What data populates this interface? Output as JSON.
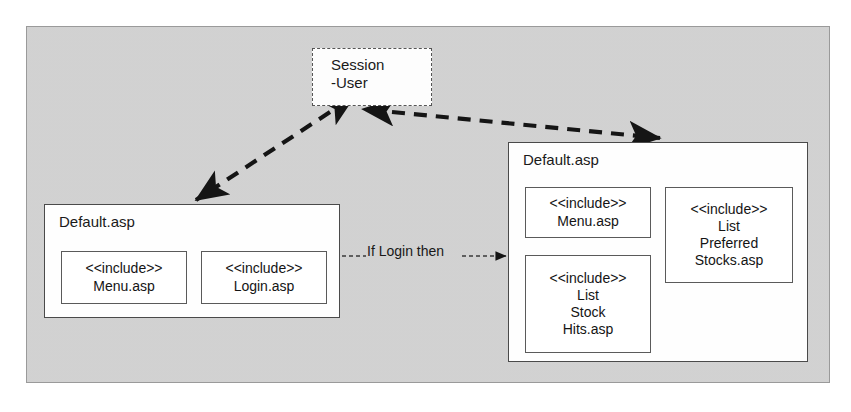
{
  "diagram": {
    "type": "component-include-diagram",
    "background_color": "#d3d3d3",
    "node_fill_color": "#ffffff",
    "line_color": "#1a1a1a"
  },
  "session": {
    "label": "Session\n-User",
    "border_style": "dashed"
  },
  "page_left": {
    "title": "Default.asp",
    "includes": [
      {
        "stereotype": "<<include>>",
        "name": "Menu.asp",
        "label": "<<include>>\nMenu.asp"
      },
      {
        "stereotype": "<<include>>",
        "name": "Login.asp",
        "label": "<<include>>\nLogin.asp"
      }
    ]
  },
  "page_right": {
    "title": "Default.asp",
    "includes": [
      {
        "stereotype": "<<include>>",
        "name": "Menu.asp",
        "label": "<<include>>\nMenu.asp"
      },
      {
        "stereotype": "<<include>>",
        "name": "List Stock Hits.asp",
        "label": "<<include>>\nList\nStock\nHits.asp"
      },
      {
        "stereotype": "<<include>>",
        "name": "List Preferred Stocks.asp",
        "label": "<<include>>\nList\nPreferred\nStocks.asp"
      }
    ]
  },
  "connectors": {
    "transition_label": "If Login then",
    "session_to_left": {
      "style": "dashed",
      "arrows": "both"
    },
    "session_to_right": {
      "style": "dashed",
      "arrows": "both"
    },
    "left_to_right": {
      "style": "dashed",
      "arrows": "forward"
    }
  }
}
